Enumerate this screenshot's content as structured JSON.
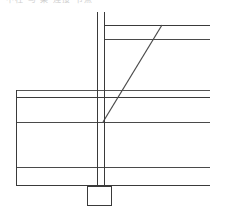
{
  "drawing": {
    "title_fragment": "中柱 与 梁 连接 节点",
    "type": "structural-connection-detail",
    "background_color": "#ffffff",
    "line_color": "#3a3a3a",
    "line_color_light": "#6e6e6e",
    "view_box": "0 0 227 214",
    "elements": {
      "column": {
        "name": "vertical-column",
        "left_flange_x": 97,
        "right_flange_x": 104.5,
        "top_y": 12,
        "bottom_y": 187
      },
      "upper_beam": {
        "name": "upper-right-beam",
        "top_line_y": 25,
        "bottom_line_y": 39,
        "start_x": 104.5,
        "end_x": 210
      },
      "brace": {
        "name": "diagonal-brace",
        "x1": 103,
        "y1": 122,
        "x2": 162,
        "y2": 25
      },
      "main_beam": {
        "name": "main-horizontal-beam",
        "top_line_y": 90,
        "second_line_y": 97,
        "third_line_y": 122,
        "start_x": 16,
        "end_x": 210
      },
      "lower_beam": {
        "name": "lower-horizontal-beam",
        "top_line_y": 167,
        "bottom_line_y": 185,
        "start_x": 16,
        "end_x": 210
      },
      "left_edge": {
        "name": "left-vertical-edge",
        "x": 16,
        "top_y": 90,
        "bottom_y": 186
      },
      "base_plate": {
        "name": "base-plate-footing",
        "x": 87,
        "y": 186,
        "width": 24,
        "height": 19
      }
    }
  }
}
